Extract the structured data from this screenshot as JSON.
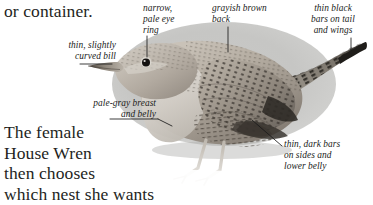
{
  "page": {
    "illustration_style": "grayscale photograph on gray oval backdrop"
  },
  "prose": {
    "top": "or container.",
    "bottom_lines": [
      "The female",
      "House Wren",
      "then chooses",
      "which nest she wants"
    ],
    "bottom": "The female\nHouse Wren\nthen chooses\nwhich nest she wants"
  },
  "annotations": [
    {
      "id": "bill",
      "text": "thin, slightly\ncurved bill",
      "align": "right",
      "points_to": "bill"
    },
    {
      "id": "eye_ring",
      "text": "narrow,\npale eye\nring",
      "align": "left",
      "points_to": "eye"
    },
    {
      "id": "back",
      "text": "grayish brown\nback",
      "align": "left",
      "points_to": "back"
    },
    {
      "id": "bars_tail_wings",
      "text": "thin black\nbars on tail\nand wings",
      "align": "center",
      "points_to": "tail-tip"
    },
    {
      "id": "breast_belly",
      "text": "pale-gray breast\nand belly",
      "align": "right",
      "points_to": "breast"
    },
    {
      "id": "bars_sides",
      "text": "thin, dark bars\non sides and\nlower belly",
      "align": "left",
      "points_to": "flank"
    }
  ],
  "colors": {
    "text": "#241f1d",
    "label_text": "#211c1a",
    "backdrop_gray": "#c7c7c5",
    "leader_line": "#1a1a1a",
    "page_background": "#ffffff",
    "plumage_light": "#d8d3cc",
    "plumage_mid": "#9a9288",
    "plumage_dark": "#3d3832"
  }
}
